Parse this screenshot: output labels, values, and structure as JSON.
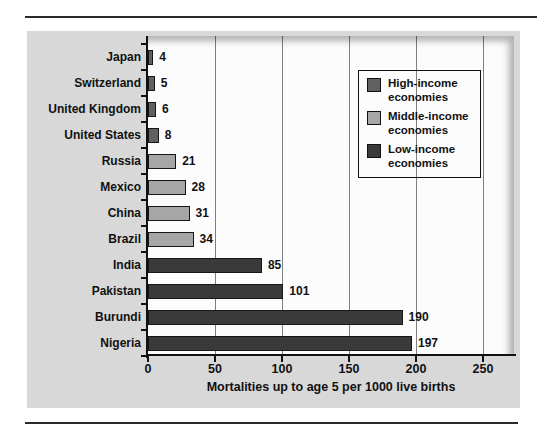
{
  "figure": {
    "panel_bg": "#d8d8d8",
    "plot_bg": "#fcfcfc",
    "gridline_color": "#7f7f7f",
    "axis_color": "#111111",
    "rule_color": "#2a2a2a"
  },
  "chart_data": {
    "type": "bar",
    "orientation": "horizontal",
    "title": "",
    "xlabel": "Mortalities up to age 5 per 1000 live births",
    "ylabel": "",
    "xlim": [
      0,
      273
    ],
    "xticks": [
      0,
      50,
      100,
      150,
      200,
      250
    ],
    "grid": "vertical gridlines at each x tick, drawn behind bars",
    "legend_position": "upper right",
    "categories": [
      "Japan",
      "Switzerland",
      "United Kingdom",
      "United States",
      "Russia",
      "Mexico",
      "China",
      "Brazil",
      "India",
      "Pakistan",
      "Burundi",
      "Nigeria"
    ],
    "values": [
      4,
      5,
      6,
      8,
      21,
      28,
      31,
      34,
      85,
      101,
      190,
      197
    ],
    "value_labels": [
      "4",
      "5",
      "6",
      "8",
      "21",
      "28",
      "31",
      "34",
      "85",
      "101",
      "190",
      "197"
    ],
    "group_of_category": [
      "high",
      "high",
      "high",
      "high",
      "middle",
      "middle",
      "middle",
      "middle",
      "low",
      "low",
      "low",
      "low"
    ],
    "groups": {
      "high": {
        "label": "High-income economies",
        "color": "#606060"
      },
      "middle": {
        "label": "Middle-income economies",
        "color": "#a6a6a6"
      },
      "low": {
        "label": "Low-income economies",
        "color": "#3a3a3a"
      }
    },
    "legend_order": [
      "high",
      "middle",
      "low"
    ],
    "bar_border_color": "#161616"
  }
}
